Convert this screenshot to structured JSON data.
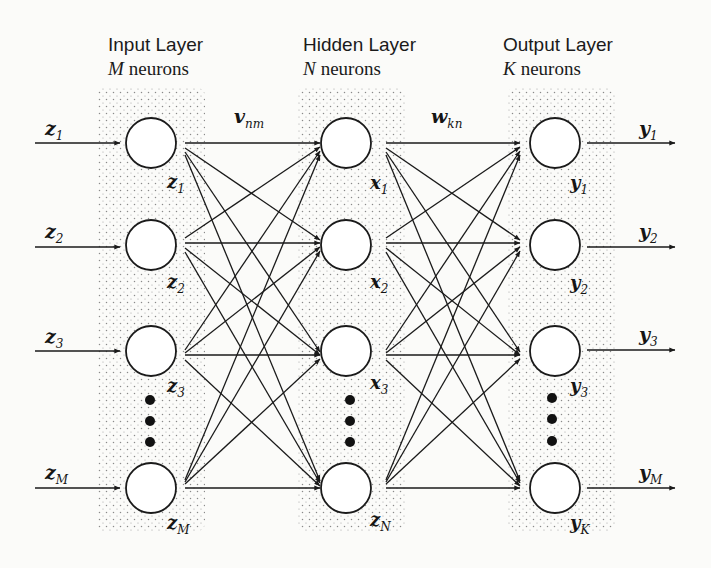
{
  "layers": [
    {
      "title": "Input Layer",
      "count_var": "M",
      "count_label": "neurons"
    },
    {
      "title": "Hidden Layer",
      "count_var": "N",
      "count_label": "neurons"
    },
    {
      "title": "Output Layer",
      "count_var": "K",
      "count_label": "neurons"
    }
  ],
  "weights": {
    "input_hidden": {
      "var": "v",
      "sub": "nm"
    },
    "hidden_output": {
      "var": "w",
      "sub": "kn"
    }
  },
  "inputs": [
    {
      "var": "z",
      "sub": "1"
    },
    {
      "var": "z",
      "sub": "2"
    },
    {
      "var": "z",
      "sub": "3"
    },
    {
      "var": "z",
      "sub": "M"
    }
  ],
  "input_neurons": [
    {
      "var": "z",
      "sub": "1"
    },
    {
      "var": "z",
      "sub": "2"
    },
    {
      "var": "z",
      "sub": "3"
    },
    {
      "var": "z",
      "sub": "M"
    }
  ],
  "hidden_neurons": [
    {
      "var": "x",
      "sub": "1"
    },
    {
      "var": "x",
      "sub": "2"
    },
    {
      "var": "x",
      "sub": "3"
    },
    {
      "var": "z",
      "sub": "N"
    }
  ],
  "output_neurons": [
    {
      "var": "y",
      "sub": "1"
    },
    {
      "var": "y",
      "sub": "2"
    },
    {
      "var": "y",
      "sub": "3"
    },
    {
      "var": "y",
      "sub": "K"
    }
  ],
  "outputs": [
    {
      "var": "y",
      "sub": "1"
    },
    {
      "var": "y",
      "sub": "2"
    },
    {
      "var": "y",
      "sub": "3"
    },
    {
      "var": "y",
      "sub": "M"
    }
  ],
  "ellipsis": "⋮",
  "colors": {
    "ink": "#1a1a1a",
    "stipple": "#8a8a8a",
    "background": "#fbfbf9"
  }
}
